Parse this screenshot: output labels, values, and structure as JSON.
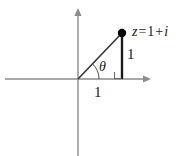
{
  "figure": {
    "background_color": "#ffffff",
    "width": 195,
    "height": 156
  },
  "colors": {
    "axis": "#8c8c8c",
    "hypotenuse": "#3a3a3a",
    "leg": "#1a1a1a",
    "point": "#000000",
    "text": "#1a1a1a",
    "right_angle": "#6e6e6e"
  },
  "axes": {
    "horizontal": {
      "name": "real-axis",
      "x_start": 5,
      "x_end": 150,
      "y": 79,
      "arrow_end": "right"
    },
    "vertical": {
      "name": "imaginary-axis",
      "y_start": 8,
      "y_end": 156,
      "x": 78,
      "arrow_end": "top"
    },
    "origin": {
      "x": 78,
      "y": 79
    }
  },
  "point": {
    "label": "z = 1 + i",
    "label_parts": {
      "variable": "z",
      "equals": "=",
      "real": "1",
      "plus": "+",
      "imaginary": "i"
    },
    "x": 122,
    "y": 33,
    "radius": 4.2
  },
  "triangle": {
    "hypotenuse": {
      "x1": 78,
      "y1": 79,
      "x2": 122,
      "y2": 33
    },
    "vertical_leg": {
      "x1": 122,
      "y1": 33,
      "x2": 122,
      "y2": 79,
      "label": "1"
    },
    "horizontal_leg": {
      "x1": 78,
      "y1": 79,
      "x2": 122,
      "y2": 79,
      "label": "1"
    },
    "right_angle_marker": {
      "x": 114,
      "y": 72,
      "size": 7
    }
  },
  "angle": {
    "label": "θ",
    "arc_radius": 21,
    "start_deg": 0,
    "end_deg": 46
  },
  "chart_data": {
    "type": "scatter",
    "xlabel": "Real axis",
    "ylabel": "Imaginary axis",
    "xlim": [
      -1.7,
      1.65
    ],
    "ylim": [
      -1.75,
      1.6
    ],
    "grid": false,
    "legend": false,
    "points": [
      {
        "label": "z = 1 + i",
        "x": 1,
        "y": 1
      }
    ],
    "annotations": [
      {
        "text": "1",
        "meaning": "length of horizontal leg (real part)",
        "x": 0.5,
        "y": -0.3
      },
      {
        "text": "1",
        "meaning": "length of vertical leg (imaginary part)",
        "x": 1.18,
        "y": 0.5
      },
      {
        "text": "θ",
        "meaning": "argument angle at origin",
        "x": 0.58,
        "y": 0.25
      }
    ],
    "segments": [
      {
        "name": "hypotenuse",
        "from": [
          0,
          0
        ],
        "to": [
          1,
          1
        ]
      },
      {
        "name": "vertical-leg",
        "from": [
          1,
          1
        ],
        "to": [
          1,
          0
        ]
      },
      {
        "name": "horizontal-leg",
        "from": [
          0,
          0
        ],
        "to": [
          1,
          0
        ]
      }
    ]
  }
}
